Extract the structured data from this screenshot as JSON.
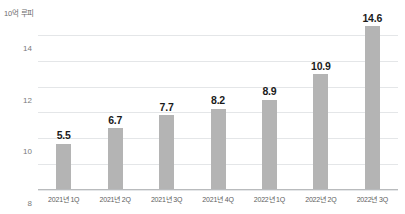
{
  "chart_data": {
    "type": "bar",
    "title": "",
    "subtitle": "",
    "xlabel": "",
    "ylabel": "10억 루피",
    "unit_caption": "10억 루피",
    "categories": [
      "2021년 1Q",
      "2021년 2Q",
      "2021년 3Q",
      "2021년 4Q",
      "2022년 1Q",
      "2022년 2Q",
      "2022년 3Q"
    ],
    "values": [
      5.5,
      6.7,
      7.7,
      8.2,
      8.9,
      10.9,
      14.6
    ],
    "value_labels": [
      "5.5",
      "6.7",
      "7.7",
      "8.2",
      "8.9",
      "10.9",
      "14.6"
    ],
    "ylim": [
      2,
      15
    ],
    "yticks": [
      2,
      4,
      6,
      8,
      10,
      12,
      14
    ],
    "ytick_labels": [
      "2",
      "4",
      "6",
      "8",
      "10",
      "12",
      "14"
    ],
    "grid": true,
    "grid_axis": "y",
    "legend": false,
    "legend_position": "none",
    "bar_color": "#b4b4b4",
    "gridline_color": "#e4e6e8",
    "baseline_color": "#b9bbbd",
    "label_color": "#1b1b1b",
    "tick_color": "#7a7a7a",
    "background": "#ffffff"
  }
}
